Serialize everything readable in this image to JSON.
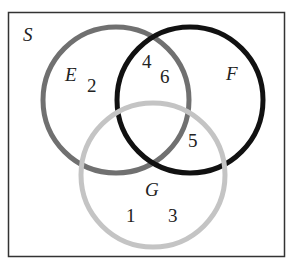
{
  "diagram": {
    "type": "venn",
    "universe": {
      "label": "S"
    },
    "sets": [
      {
        "label": "E",
        "color": "#707070"
      },
      {
        "label": "F",
        "color": "#111111"
      },
      {
        "label": "G",
        "color": "#c4c4c4"
      }
    ],
    "elements": {
      "E_only": [
        "2"
      ],
      "E_and_F_only": [
        "4",
        "6"
      ],
      "F_and_G_only": [
        "5"
      ],
      "G_only": [
        "1",
        "3"
      ]
    },
    "numbers": [
      "2",
      "4",
      "6",
      "5",
      "1",
      "3"
    ]
  }
}
